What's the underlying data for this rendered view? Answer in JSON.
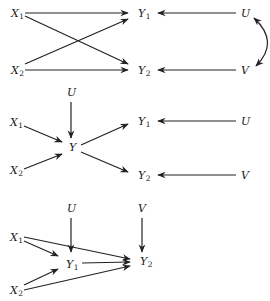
{
  "diagrams": [
    {
      "id": "top",
      "nodes": [
        {
          "id": "X1",
          "base": "X",
          "sub": "1",
          "x": 11,
          "y": 17
        },
        {
          "id": "X2",
          "base": "X",
          "sub": "2",
          "x": 11,
          "y": 74
        },
        {
          "id": "Y1",
          "base": "Y",
          "sub": "1",
          "x": 138,
          "y": 17
        },
        {
          "id": "Y2",
          "base": "Y",
          "sub": "2",
          "x": 138,
          "y": 74
        },
        {
          "id": "U",
          "base": "U",
          "sub": "",
          "x": 241,
          "y": 17
        },
        {
          "id": "V",
          "base": "V",
          "sub": "",
          "x": 241,
          "y": 74
        }
      ],
      "edges": [
        {
          "from": "X1",
          "to": "Y1",
          "x1": 25,
          "y1": 13,
          "x2": 128,
          "y2": 13
        },
        {
          "from": "X1",
          "to": "Y2",
          "x1": 25,
          "y1": 16,
          "x2": 128,
          "y2": 64
        },
        {
          "from": "X2",
          "to": "Y1",
          "x1": 25,
          "y1": 64,
          "x2": 128,
          "y2": 19
        },
        {
          "from": "X2",
          "to": "Y2",
          "x1": 25,
          "y1": 70,
          "x2": 128,
          "y2": 70
        },
        {
          "from": "U",
          "to": "Y1",
          "x1": 236,
          "y1": 13,
          "x2": 158,
          "y2": 13
        },
        {
          "from": "V",
          "to": "Y2",
          "x1": 236,
          "y1": 70,
          "x2": 158,
          "y2": 70
        }
      ],
      "curved": [
        {
          "between": [
            "U",
            "V"
          ],
          "bidirectional": true,
          "path": "M 254 18 Q 280 42 256 66"
        }
      ]
    },
    {
      "id": "middle",
      "nodes": [
        {
          "id": "U_top",
          "base": "U",
          "sub": "",
          "x": 67,
          "y": 96
        },
        {
          "id": "X1",
          "base": "X",
          "sub": "1",
          "x": 10,
          "y": 126
        },
        {
          "id": "Y",
          "base": "Y",
          "sub": "",
          "x": 69,
          "y": 151
        },
        {
          "id": "X2",
          "base": "X",
          "sub": "2",
          "x": 10,
          "y": 174
        },
        {
          "id": "Y1",
          "base": "Y",
          "sub": "1",
          "x": 138,
          "y": 125
        },
        {
          "id": "Y2",
          "base": "Y",
          "sub": "2",
          "x": 138,
          "y": 179
        },
        {
          "id": "U_right",
          "base": "U",
          "sub": "",
          "x": 241,
          "y": 125
        },
        {
          "id": "V",
          "base": "V",
          "sub": "",
          "x": 241,
          "y": 179
        }
      ],
      "edges": [
        {
          "from": "U_top",
          "to": "Y",
          "x1": 71,
          "y1": 102,
          "x2": 71,
          "y2": 138
        },
        {
          "from": "X1",
          "to": "Y",
          "x1": 24,
          "y1": 126,
          "x2": 62,
          "y2": 142
        },
        {
          "from": "X2",
          "to": "Y",
          "x1": 24,
          "y1": 169,
          "x2": 62,
          "y2": 154
        },
        {
          "from": "Y",
          "to": "Y1",
          "x1": 81,
          "y1": 145,
          "x2": 128,
          "y2": 124
        },
        {
          "from": "Y",
          "to": "Y2",
          "x1": 81,
          "y1": 152,
          "x2": 128,
          "y2": 172
        },
        {
          "from": "U_right",
          "to": "Y1",
          "x1": 236,
          "y1": 121,
          "x2": 158,
          "y2": 121
        },
        {
          "from": "V",
          "to": "Y2",
          "x1": 236,
          "y1": 175,
          "x2": 158,
          "y2": 175
        }
      ],
      "curved": []
    },
    {
      "id": "bottom",
      "nodes": [
        {
          "id": "U",
          "base": "U",
          "sub": "",
          "x": 67,
          "y": 212
        },
        {
          "id": "V",
          "base": "V",
          "sub": "",
          "x": 138,
          "y": 212
        },
        {
          "id": "X1",
          "base": "X",
          "sub": "1",
          "x": 10,
          "y": 241
        },
        {
          "id": "Y1",
          "base": "Y",
          "sub": "1",
          "x": 66,
          "y": 268
        },
        {
          "id": "Y2",
          "base": "Y",
          "sub": "2",
          "x": 140,
          "y": 265
        },
        {
          "id": "X2",
          "base": "X",
          "sub": "2",
          "x": 10,
          "y": 294
        }
      ],
      "edges": [
        {
          "from": "U",
          "to": "Y1",
          "x1": 71,
          "y1": 218,
          "x2": 71,
          "y2": 252
        },
        {
          "from": "V",
          "to": "Y2",
          "x1": 142,
          "y1": 218,
          "x2": 142,
          "y2": 252
        },
        {
          "from": "X1",
          "to": "Y1",
          "x1": 24,
          "y1": 241,
          "x2": 58,
          "y2": 256
        },
        {
          "from": "X1",
          "to": "Y2",
          "x1": 24,
          "y1": 237,
          "x2": 130,
          "y2": 259
        },
        {
          "from": "Y1",
          "to": "Y2",
          "x1": 82,
          "y1": 263,
          "x2": 130,
          "y2": 262
        },
        {
          "from": "X2",
          "to": "Y1",
          "x1": 24,
          "y1": 285,
          "x2": 58,
          "y2": 269
        },
        {
          "from": "X2",
          "to": "Y2",
          "x1": 24,
          "y1": 290,
          "x2": 130,
          "y2": 266
        }
      ],
      "curved": []
    }
  ]
}
